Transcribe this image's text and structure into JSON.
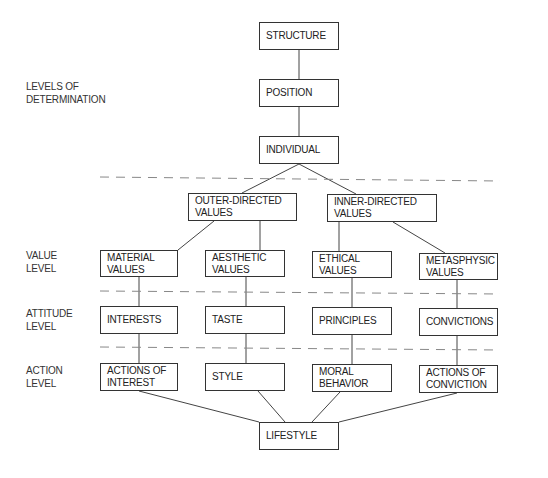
{
  "levels": {
    "determination": "LEVELS OF\nDETERMINATION",
    "value": "VALUE\nLEVEL",
    "attitude": "ATTITUDE\nLEVEL",
    "action": "ACTION\nLEVEL"
  },
  "determination": {
    "structure": "STRUCTURE",
    "position": "POSITION",
    "individual": "INDIVIDUAL"
  },
  "directed": {
    "outer": "OUTER-DIRECTED\nVALUES",
    "inner": "INNER-DIRECTED\nVALUES"
  },
  "values": [
    "MATERIAL\nVALUES",
    "AESTHETIC\nVALUES",
    "ETHICAL\nVALUES",
    "METASPHYSIC\nVALUES"
  ],
  "attitudes": [
    "INTERESTS",
    "TASTE",
    "PRINCIPLES",
    "CONVICTIONS"
  ],
  "actions": [
    "ACTIONS OF\nINTEREST",
    "STYLE",
    "MORAL\nBEHAVIOR",
    "ACTIONS OF\nCONVICTION"
  ],
  "outcome": "LIFESTYLE"
}
